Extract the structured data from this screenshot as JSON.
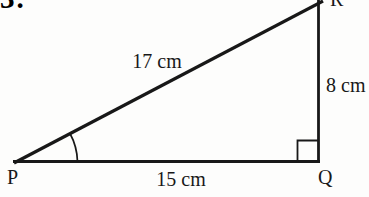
{
  "page": {
    "background": "#fdfdfc",
    "ink": "#181818"
  },
  "question": {
    "number": "3."
  },
  "triangle": {
    "vertices": {
      "p": "P",
      "q": "Q",
      "r": "R"
    },
    "sides": {
      "hypotenuse_label": "17 cm",
      "vertical_label": "8 cm",
      "base_label": "15 cm"
    },
    "markers": {
      "right_angle_at": "Q",
      "angle_arc_at": "P"
    }
  }
}
